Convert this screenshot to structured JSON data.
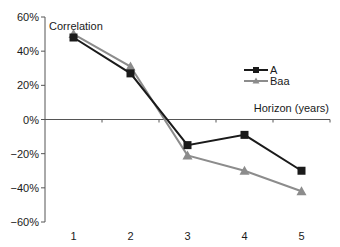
{
  "chart_data": {
    "type": "line",
    "title": "",
    "xlabel": "Horizon (years)",
    "ylabel": "Correlation",
    "categories": [
      "1",
      "2",
      "3",
      "4",
      "5"
    ],
    "ylim": [
      -0.6,
      0.6
    ],
    "yticks": [
      "60%",
      "40%",
      "20%",
      "0%",
      "−20%",
      "−40%",
      "−60%"
    ],
    "grid": false,
    "legend_position": "inside-right",
    "series": [
      {
        "name": "A",
        "color": "#1a1a1a",
        "marker": "square",
        "values": [
          0.48,
          0.27,
          -0.15,
          -0.09,
          -0.3
        ]
      },
      {
        "name": "Baa",
        "color": "#8c8c8c",
        "marker": "triangle",
        "values": [
          0.5,
          0.31,
          -0.21,
          -0.3,
          -0.42
        ]
      }
    ]
  },
  "labels": {
    "y_axis_title": "Correlation",
    "x_axis_title": "Horizon (years)",
    "legend_a": "A",
    "legend_baa": "Baa"
  }
}
